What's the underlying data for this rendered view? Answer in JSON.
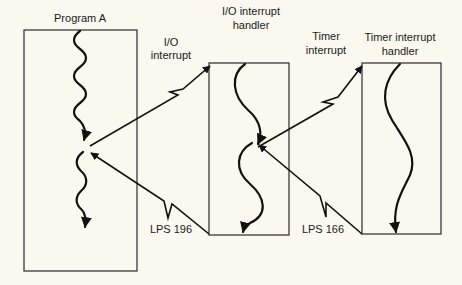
{
  "diagram": {
    "background": "#fbf8ef",
    "ink": "#111111",
    "boxes": [
      {
        "id": "program-a",
        "label_lines": [
          "Program A"
        ]
      },
      {
        "id": "io-handler",
        "label_lines": [
          "I/O interrupt",
          "handler"
        ]
      },
      {
        "id": "timer-handler",
        "label_lines": [
          "Timer interrupt",
          "handler"
        ]
      }
    ],
    "edges": [
      {
        "id": "io-interrupt",
        "label_lines": [
          "I/O",
          "interrupt"
        ],
        "from": "program-a",
        "to": "io-handler"
      },
      {
        "id": "timer-interrupt",
        "label_lines": [
          "Timer",
          "interrupt"
        ],
        "from": "io-handler",
        "to": "timer-handler"
      },
      {
        "id": "lps-196",
        "label": "LPS 196",
        "from": "io-handler",
        "to": "program-a"
      },
      {
        "id": "lps-166",
        "label": "LPS 166",
        "from": "timer-handler",
        "to": "io-handler"
      }
    ]
  }
}
